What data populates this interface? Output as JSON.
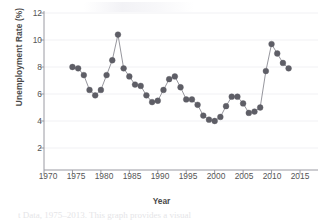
{
  "chart_data": {
    "type": "scatter",
    "title": "",
    "xlabel": "Year",
    "ylabel": "Unemployment Rate (%)",
    "xlim": [
      1970,
      2015
    ],
    "ylim": [
      0,
      12
    ],
    "grid": true,
    "legend": null,
    "marker_color": "#5e5e66",
    "line_color": "#8a8a92",
    "axis_color": "#9a9aa2",
    "text_color": "#555555",
    "xticks": [
      1970,
      1975,
      1980,
      1985,
      1990,
      1995,
      2000,
      2005,
      2010,
      2015
    ],
    "yticks": [
      2,
      4,
      6,
      8,
      10,
      12
    ],
    "x": [
      1975,
      1976,
      1977,
      1978,
      1979,
      1980,
      1981,
      1982,
      1983,
      1984,
      1985,
      1986,
      1987,
      1988,
      1989,
      1990,
      1991,
      1992,
      1993,
      1994,
      1995,
      1996,
      1997,
      1998,
      1999,
      2000,
      2001,
      2002,
      2003,
      2004,
      2005,
      2006,
      2007,
      2008,
      2009,
      2010,
      2011,
      2012,
      2013
    ],
    "values": [
      8.0,
      7.9,
      7.4,
      6.3,
      5.9,
      6.3,
      7.4,
      8.5,
      10.4,
      7.9,
      7.3,
      6.7,
      6.6,
      5.9,
      5.4,
      5.5,
      6.3,
      7.1,
      7.3,
      6.5,
      5.6,
      5.6,
      5.2,
      4.4,
      4.1,
      4.0,
      4.3,
      5.1,
      5.8,
      5.8,
      5.3,
      4.6,
      4.7,
      5.0,
      7.7,
      9.7,
      9.0,
      8.3,
      7.9
    ],
    "series_name": "Unemployment Rate"
  },
  "axes": {
    "y_tick_labels": [
      "12",
      "10",
      "8",
      "6",
      "4",
      "2"
    ],
    "x_tick_labels": [
      "1970",
      "1975",
      "1980",
      "1985",
      "1990",
      "1995",
      "2000",
      "2005",
      "2010",
      "2015"
    ]
  },
  "labels": {
    "y_axis_title": "Unemployment Rate (%)",
    "x_axis_title": "Year"
  },
  "page": {
    "cropped_caption": "t Data, 1975–2013.  This graph provides a visual"
  }
}
